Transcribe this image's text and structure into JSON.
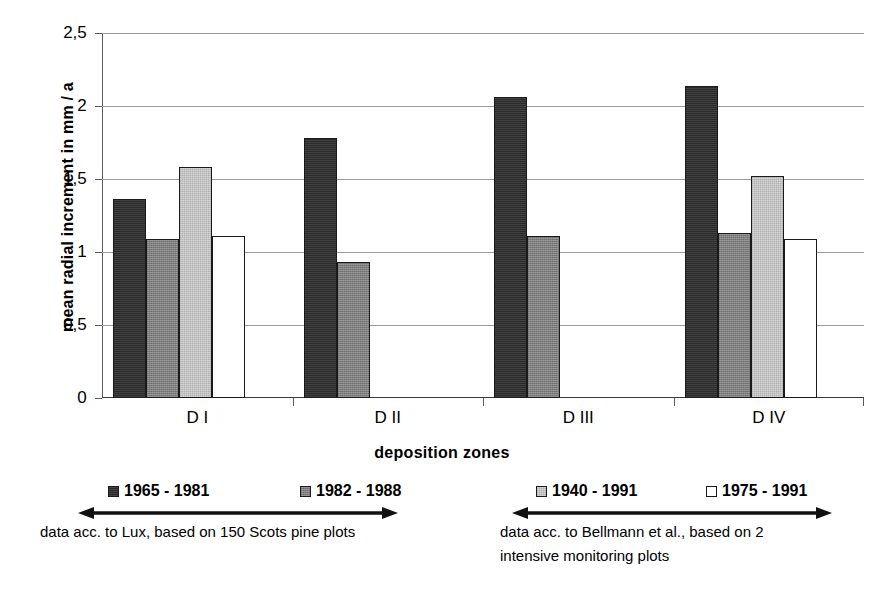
{
  "chart_data": {
    "type": "bar",
    "title": "",
    "xlabel": "deposition zones",
    "ylabel": "mean radial increment in mm / a",
    "categories": [
      "D I",
      "D II",
      "D III",
      "D IV"
    ],
    "ylim": [
      0,
      2.5
    ],
    "ytick_values": [
      0,
      0.5,
      1,
      1.5,
      2,
      2.5
    ],
    "ytick_labels": [
      "0",
      "0,5",
      "1",
      "1,5",
      "2",
      "2,5"
    ],
    "grid": "horizontal",
    "legend_position": "below-plot",
    "series": [
      {
        "name": "1965 - 1981",
        "fill": "s0",
        "values": [
          1.36,
          1.78,
          2.06,
          2.14
        ]
      },
      {
        "name": "1982 - 1988",
        "fill": "s1",
        "values": [
          1.09,
          0.93,
          1.11,
          1.13
        ]
      },
      {
        "name": "1940 - 1991",
        "fill": "s2",
        "values": [
          1.58,
          null,
          null,
          1.52
        ]
      },
      {
        "name": "1975 - 1991",
        "fill": "s3",
        "values": [
          1.11,
          null,
          null,
          1.09
        ]
      }
    ],
    "annotations": [
      "data acc. to Lux, based on 150 Scots pine plots",
      "data acc. to Bellmann et al., based on 2 intensive monitoring plots"
    ]
  },
  "axis": {
    "y_title": "mean radial increment in mm / a",
    "x_title": "deposition zones"
  },
  "legend": {
    "entries": [
      {
        "label": "1965 - 1981",
        "fill": "s0"
      },
      {
        "label": "1982 - 1988",
        "fill": "s1"
      },
      {
        "label": "1940 - 1991",
        "fill": "s2"
      },
      {
        "label": "1975 - 1991",
        "fill": "s3"
      }
    ]
  },
  "notes": {
    "left": "data acc. to Lux, based on 150 Scots pine plots",
    "right_line1": "data acc. to Bellmann et al., based on 2",
    "right_line2": "intensive monitoring plots"
  },
  "colors": {
    "series_0": "#2b2b2b",
    "series_1": "#7d7d7d",
    "series_2": "#c3c3c3",
    "series_3": "#ffffff",
    "grid": "#9a9a9a",
    "axis": "#3a3a3a",
    "text": "#000000"
  }
}
